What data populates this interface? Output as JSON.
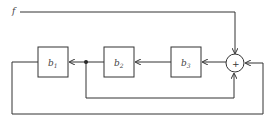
{
  "diagram": {
    "type": "block-diagram",
    "input": {
      "label": "f"
    },
    "summing_junction": {
      "symbol": "+"
    },
    "blocks": [
      {
        "id": "b1",
        "base": "b",
        "subscript": "1"
      },
      {
        "id": "b2",
        "base": "b",
        "subscript": "2"
      },
      {
        "id": "b3",
        "base": "b",
        "subscript": "3"
      }
    ],
    "connections": [
      {
        "from": "f",
        "to": "sum"
      },
      {
        "from": "sum",
        "to": "b3"
      },
      {
        "from": "b3",
        "to": "b2"
      },
      {
        "from": "b2",
        "to": "junction"
      },
      {
        "from": "junction",
        "to": "b1"
      },
      {
        "from": "junction",
        "to": "sum",
        "note": "inner feedback into bottom of sum"
      },
      {
        "from": "b1",
        "to": "sum",
        "note": "outer feedback into right of sum"
      }
    ],
    "colors": {
      "line": "#333333",
      "text": "#444444",
      "background": "#ffffff"
    }
  }
}
